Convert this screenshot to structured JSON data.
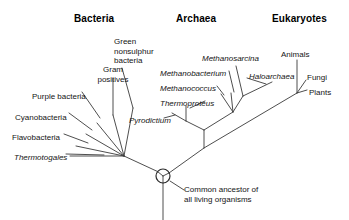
{
  "figure": {
    "background_color": "#ffffff",
    "line_color": "#3a3a3a",
    "text_color": "#141414",
    "width": 349,
    "height": 220
  },
  "headings": [
    {
      "label": "Bacteria",
      "x": 74,
      "y": 14
    },
    {
      "label": "Archaea",
      "x": 176,
      "y": 14
    },
    {
      "label": "Eukaryotes",
      "x": 272,
      "y": 14
    }
  ],
  "taxa": {
    "bacteria": [
      {
        "label": "Purple bacteria",
        "x": 32,
        "y": 92,
        "italic": false,
        "align": "left"
      },
      {
        "label": "Cyanobacteria",
        "x": 15,
        "y": 113,
        "italic": false,
        "align": "left"
      },
      {
        "label": "Flavobacteria",
        "x": 12,
        "y": 133,
        "italic": false,
        "align": "left"
      },
      {
        "label": "Thermotogales",
        "x": 14,
        "y": 153,
        "italic": true,
        "align": "left"
      },
      {
        "label": "Gram\npositives",
        "x": 93,
        "y": 65,
        "italic": false,
        "align": "center"
      },
      {
        "label": "Green\nnonsulphur\nbacteria",
        "x": 114,
        "y": 37,
        "italic": false,
        "align": "left"
      }
    ],
    "archaea": [
      {
        "label": "Pyrodictium",
        "x": 129,
        "y": 116,
        "italic": true,
        "align": "left"
      },
      {
        "label": "Thermoproteus",
        "x": 160,
        "y": 99,
        "italic": true,
        "align": "left"
      },
      {
        "label": "Methanococcus",
        "x": 160,
        "y": 84,
        "italic": true,
        "align": "left"
      },
      {
        "label": "Methanobacterium",
        "x": 160,
        "y": 69,
        "italic": true,
        "align": "left"
      },
      {
        "label": "Methanosarcina",
        "x": 202,
        "y": 54,
        "italic": true,
        "align": "left"
      },
      {
        "label": "Haloarchaea",
        "x": 249,
        "y": 72,
        "italic": true,
        "align": "left"
      }
    ],
    "eukaryotes": [
      {
        "label": "Animals",
        "x": 281,
        "y": 50,
        "italic": false,
        "align": "left"
      },
      {
        "label": "Fungi",
        "x": 307,
        "y": 73,
        "italic": false,
        "align": "left"
      },
      {
        "label": "Plants",
        "x": 309,
        "y": 88,
        "italic": false,
        "align": "left"
      }
    ]
  },
  "annotation": {
    "label": "Common ancestor of\nall living organisms",
    "line1": "Common ancestor of",
    "line2": "all living organisms",
    "x": 184,
    "y": 185
  },
  "root_node": {
    "name": "common-ancestor-node",
    "cx": 163,
    "cy": 176,
    "r": 7
  }
}
